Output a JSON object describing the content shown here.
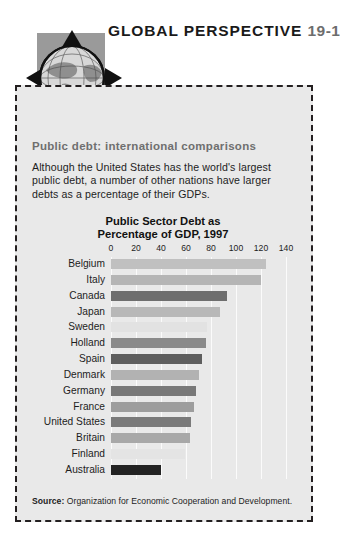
{
  "header": {
    "title_main": "GLOBAL PERSPECTIVE",
    "title_number": "19-1",
    "globe_icon": "globe-icon"
  },
  "panel": {
    "subtitle": "Public debt: international comparisons",
    "body": "Although the United States has the world's largest public debt, a number of other nations have larger debts as a percentage of their GDPs.",
    "source_label": "Source:",
    "source_text": "Organization for Economic Cooperation and Development."
  },
  "chart_data": {
    "type": "bar",
    "orientation": "horizontal",
    "title": "Public Sector Debt as Percentage of GDP, 1997",
    "title_line1": "Public Sector Debt as",
    "title_line2": "Percentage of GDP, 1997",
    "xlabel": "",
    "ylabel": "",
    "xlim": [
      0,
      140
    ],
    "xticks": [
      0,
      20,
      40,
      60,
      80,
      100,
      120,
      140
    ],
    "tick_labels": [
      "0",
      "20",
      "40",
      "60",
      "80",
      "100",
      "120",
      "140"
    ],
    "grid": true,
    "legend": false,
    "categories": [
      "Belgium",
      "Italy",
      "Canada",
      "Japan",
      "Sweden",
      "Holland",
      "Spain",
      "Denmark",
      "Germany",
      "France",
      "United States",
      "Britain",
      "Finland",
      "Australia"
    ],
    "values": [
      124,
      120,
      93,
      87,
      77,
      76,
      73,
      70,
      68,
      66,
      64,
      63,
      59,
      40
    ],
    "bar_colors": [
      "#c0c0c0",
      "#b5b5b5",
      "#6e6e6e",
      "#b8b8b8",
      "#e2e2e2",
      "#8a8a8a",
      "#5e5e5e",
      "#b2b2b2",
      "#787878",
      "#9d9d9d",
      "#7a7a7a",
      "#a8a8a8",
      "#e4e4e4",
      "#232323"
    ]
  }
}
